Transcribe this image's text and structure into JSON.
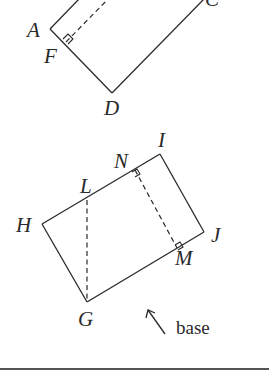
{
  "figure1": {
    "labels": {
      "A": "A",
      "F": "F",
      "C": "C",
      "D": "D"
    }
  },
  "figure2": {
    "labels": {
      "H": "H",
      "L": "L",
      "N": "N",
      "I": "I",
      "J": "J",
      "M": "M",
      "G": "G"
    },
    "annotation": "base"
  }
}
